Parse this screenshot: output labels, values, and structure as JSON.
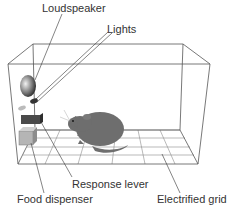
{
  "diagram": {
    "labels": {
      "loudspeaker": "Loudspeaker",
      "lights": "Lights",
      "response_lever": "Response lever",
      "food_dispenser": "Food dispenser",
      "electrified_grid": "Electrified grid"
    },
    "colors": {
      "line": "#555555",
      "text": "#333333",
      "rat": "#6e6e6e",
      "lever": "#4a4a4a",
      "dispenser": "#a8a8a8"
    }
  }
}
